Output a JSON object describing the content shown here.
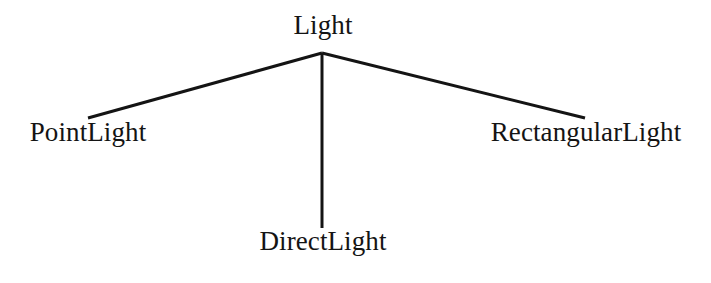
{
  "diagram": {
    "type": "class-hierarchy-tree",
    "background_color": "#ffffff",
    "edge_color": "#141414",
    "edge_width_px": 3,
    "text_color": "#141414",
    "root": {
      "id": "light",
      "label": "Light",
      "x": 323,
      "y": 12
    },
    "children": [
      {
        "id": "pointlight",
        "label": "PointLight",
        "x": 88,
        "y": 119
      },
      {
        "id": "directlight",
        "label": "DirectLight",
        "x": 323,
        "y": 228
      },
      {
        "id": "rectangularlight",
        "label": "RectangularLight",
        "x": 586,
        "y": 119
      }
    ],
    "apex": {
      "x": 322,
      "y": 53
    },
    "edges": [
      {
        "id": "edge-light-pointlight",
        "from": "light",
        "to": "pointlight",
        "x1": 322,
        "y1": 53,
        "x2": 88,
        "y2": 118
      },
      {
        "id": "edge-light-directlight",
        "from": "light",
        "to": "directlight",
        "x1": 322,
        "y1": 53,
        "x2": 322,
        "y2": 228
      },
      {
        "id": "edge-light-rectlight",
        "from": "light",
        "to": "rectangularlight",
        "x1": 322,
        "y1": 53,
        "x2": 585,
        "y2": 118
      }
    ]
  }
}
